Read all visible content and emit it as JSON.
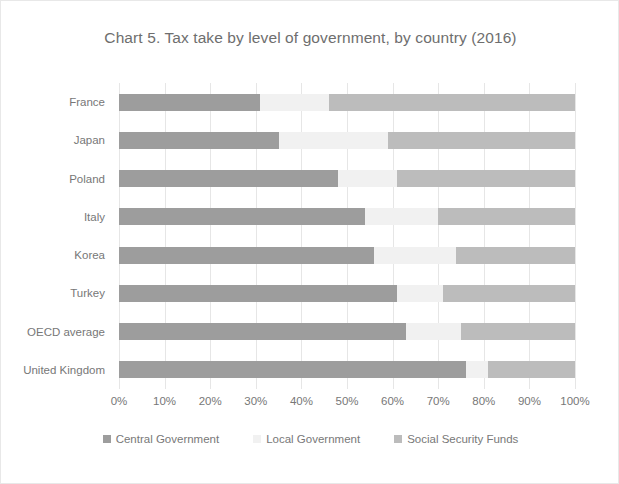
{
  "chart_data": {
    "type": "bar",
    "orientation": "horizontal",
    "stacked": true,
    "stack_mode": "percent",
    "title": "Chart 5. Tax take by level of government, by country (2016)",
    "xlabel": "",
    "ylabel": "",
    "xlim": [
      0,
      100
    ],
    "grid": true,
    "legend_position": "bottom",
    "xtick_labels": [
      "0%",
      "10%",
      "20%",
      "30%",
      "40%",
      "50%",
      "60%",
      "70%",
      "80%",
      "90%",
      "100%"
    ],
    "xtick_values": [
      0,
      10,
      20,
      30,
      40,
      50,
      60,
      70,
      80,
      90,
      100
    ],
    "categories": [
      "France",
      "Japan",
      "Poland",
      "Italy",
      "Korea",
      "Turkey",
      "OECD average",
      "United Kingdom"
    ],
    "series": [
      {
        "name": "Central Government",
        "color": "#9d9d9d",
        "values": [
          31,
          35,
          48,
          54,
          56,
          61,
          63,
          76
        ]
      },
      {
        "name": "Local Government",
        "color": "#f1f1f1",
        "values": [
          15,
          24,
          13,
          16,
          18,
          10,
          12,
          5
        ]
      },
      {
        "name": "Social Security Funds",
        "color": "#bcbcbc",
        "values": [
          54,
          41,
          39,
          30,
          26,
          29,
          25,
          19
        ]
      }
    ]
  }
}
